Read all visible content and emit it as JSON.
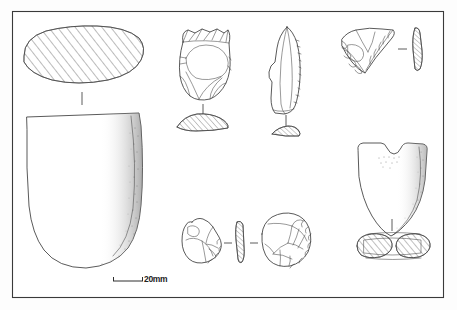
{
  "plate": {
    "title": "Archaeological lithic and ground stone artefact illustration plate",
    "background_color": "#ffffff",
    "ink_color": "#3c3c3c",
    "frame": {
      "name": "plate-border",
      "x": 12,
      "y": 11,
      "width": 432,
      "height": 287,
      "stroke_color": "#3a3a3a"
    },
    "scale": {
      "label": "20mm",
      "bar_x": 113,
      "bar_y": 280,
      "bar_length": 30,
      "tick_height": 5,
      "label_x": 145,
      "label_y": 274
    },
    "figures": [
      {
        "id": "fig-1",
        "name": "polished-stone-adze",
        "type": "ground-stone-adze",
        "views": [
          {
            "name": "cross-section-oval-hatched",
            "style": "hatched-oval",
            "cx": 82,
            "cy": 57,
            "rx": 60,
            "ry": 28
          },
          {
            "name": "face-view-adze-blade",
            "style": "outline-shaded",
            "cx": 82,
            "cy": 190
          }
        ],
        "connector": {
          "name": "view-connector-tick",
          "x": 82,
          "y": 95,
          "length": 14
        }
      },
      {
        "id": "fig-2",
        "name": "flint-core-scraper",
        "type": "flaked-flint-core",
        "views": [
          {
            "name": "dorsal-face-flake-scars",
            "style": "outline-flakescars",
            "cx": 204,
            "cy": 60
          },
          {
            "name": "cross-section-lens-hatched",
            "style": "hatched-lens",
            "cx": 200,
            "cy": 122
          }
        ],
        "connector": {
          "name": "view-connector-tick",
          "x": 203,
          "y": 103,
          "length": 11
        }
      },
      {
        "id": "fig-3",
        "name": "retouched-blade-flake",
        "type": "flint-blade",
        "views": [
          {
            "name": "dorsal-face-blade",
            "style": "outline-blade",
            "cx": 288,
            "cy": 65
          },
          {
            "name": "cross-section-thin-hatched",
            "style": "hatched-sliver",
            "cx": 288,
            "cy": 131
          }
        ],
        "connector": {
          "name": "view-connector-tick",
          "x": 288,
          "y": 112,
          "length": 13
        }
      },
      {
        "id": "fig-4",
        "name": "triangular-retouched-scraper",
        "type": "flint-scraper",
        "views": [
          {
            "name": "dorsal-face-triangular",
            "style": "outline-retouched",
            "cx": 366,
            "cy": 47
          },
          {
            "name": "edge-profile-hatched",
            "style": "hatched-narrow-vertical",
            "cx": 417,
            "cy": 47
          }
        ],
        "connector": {
          "name": "view-connector-dash",
          "x": 398,
          "y": 49,
          "length": 9,
          "orientation": "horizontal"
        }
      },
      {
        "id": "fig-5",
        "name": "notched-waisted-stone-tool",
        "type": "ground-stone-notched-tool",
        "views": [
          {
            "name": "face-view-notched",
            "style": "outline-shaded-stippled",
            "cx": 392,
            "cy": 185
          },
          {
            "name": "cross-section-double-oval-hatched",
            "style": "hatched-double-oval",
            "cx": 392,
            "cy": 246
          }
        ],
        "connector": {
          "name": "view-connector-tick",
          "x": 392,
          "y": 219,
          "length": 13
        }
      },
      {
        "id": "fig-6",
        "name": "small-flint-scraper-three-views",
        "type": "flint-scraper",
        "views": [
          {
            "name": "ventral-face-view",
            "style": "outline-flakescars",
            "cx": 203,
            "cy": 242
          },
          {
            "name": "edge-profile-hatched",
            "style": "hatched-narrow-vertical",
            "cx": 239,
            "cy": 242
          },
          {
            "name": "dorsal-face-view",
            "style": "outline-flakescars",
            "cx": 279,
            "cy": 240
          }
        ],
        "connectors": [
          {
            "name": "view-connector-dash",
            "x": 224,
            "y": 243,
            "length": 8,
            "orientation": "horizontal"
          },
          {
            "name": "view-connector-dash",
            "x": 250,
            "y": 243,
            "length": 8,
            "orientation": "horizontal"
          }
        ]
      }
    ]
  }
}
